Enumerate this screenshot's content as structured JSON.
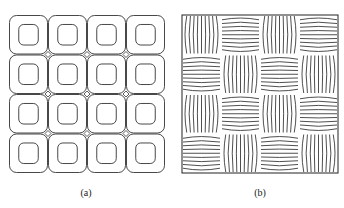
{
  "figure": {
    "panels": [
      {
        "id": "a",
        "caption": "(a)",
        "description": "4x4 grid of rounded square cells, each containing a smaller inner rounded square",
        "rows": 4,
        "cols": 4,
        "stroke": "#333333"
      },
      {
        "id": "b",
        "caption": "(b)",
        "description": "4x4 checkerboard of line-hatched cells alternating vertical and horizontal curved line bundles",
        "rows": 4,
        "cols": 4,
        "stroke": "#222222",
        "lines_per_cell": 9
      }
    ]
  }
}
